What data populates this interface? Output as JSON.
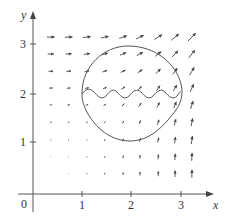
{
  "figure": {
    "type": "vector-field",
    "axes": {
      "x_label": "x",
      "y_label": "y",
      "origin_label": "0",
      "x_ticks": [
        {
          "value": 1,
          "label": "1"
        },
        {
          "value": 2,
          "label": "2"
        },
        {
          "value": 3,
          "label": "3"
        }
      ],
      "y_ticks": [
        {
          "value": 1,
          "label": "1"
        },
        {
          "value": 2,
          "label": "2"
        },
        {
          "value": 3,
          "label": "3"
        }
      ]
    },
    "grid": {
      "columns_x": [
        0.36,
        0.72,
        1.09,
        1.45,
        1.82,
        2.16,
        2.53,
        2.87,
        3.21
      ],
      "rows_y": [
        0.41,
        0.75,
        1.09,
        1.45,
        1.8,
        2.14,
        2.48,
        2.83,
        3.17
      ]
    },
    "curves": {
      "closed_loop": "egg-shaped closed curve from (1,2) up through (2,3.0) to (3.05,2), down through (2,1.08) back to (1,2)",
      "wavy_line": "oscillating curve along y≈2 from x=1 to x=3.05 with 4 waves"
    },
    "colors": {
      "ink": "#444444",
      "background": "#ffffff"
    }
  }
}
